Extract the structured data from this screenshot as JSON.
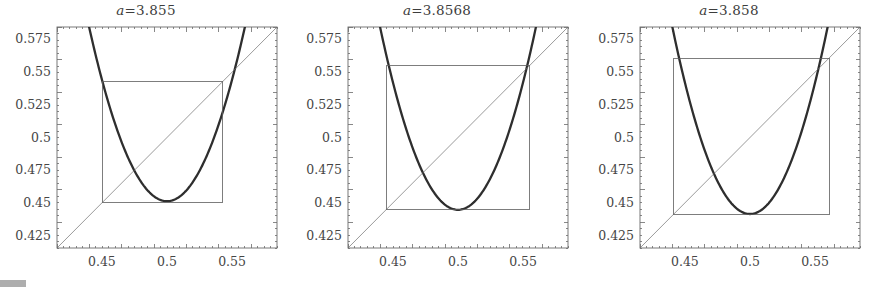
{
  "figure": {
    "background": "#ffffff",
    "curve_color": "#2e2e2e",
    "diagonal_color": "#6e6e6e",
    "box_color": "#5c5c5c",
    "frame_color": "#6a6a6a",
    "text_color": "#3d3d3d"
  },
  "caption_fragment": "",
  "chart_data": [
    {
      "type": "line",
      "title": "a=3.855",
      "title_parts": {
        "variable": "a",
        "relation": "=",
        "value": "3.855"
      },
      "parameter_a": 3.855,
      "xlabel": "",
      "ylabel": "",
      "xlim": [
        0.4155,
        0.5845
      ],
      "ylim": [
        0.4155,
        0.5845
      ],
      "grid": false,
      "legend": "none",
      "xticks": [
        0.45,
        0.5,
        0.55
      ],
      "xticklabels": [
        "0.45",
        "0.5",
        "0.55"
      ],
      "yticks": [
        0.425,
        0.45,
        0.475,
        0.5,
        0.525,
        0.55,
        0.575
      ],
      "yticklabels": [
        "0.425",
        "0.45",
        "0.475",
        "0.5",
        "0.525",
        "0.55",
        "0.575"
      ],
      "series": [
        {
          "name": "second-iterate-parabola",
          "kind": "parabola",
          "vertex": [
            0.5,
            0.4513
          ],
          "curvature": 37.2,
          "linewidth": 2.3
        },
        {
          "name": "identity-line",
          "kind": "diagonal",
          "x": [
            0.4155,
            0.5845
          ],
          "y": [
            0.4155,
            0.5845
          ],
          "linewidth": 0.7
        },
        {
          "name": "cobweb-box",
          "kind": "rectangle",
          "x0": 0.4505,
          "x1": 0.5425,
          "y0": 0.4505,
          "y1": 0.5425,
          "linewidth": 0.8
        }
      ]
    },
    {
      "type": "line",
      "title": "a=3.8568",
      "title_parts": {
        "variable": "a",
        "relation": "=",
        "value": "3.8568"
      },
      "parameter_a": 3.8568,
      "xlabel": "",
      "ylabel": "",
      "xlim": [
        0.4155,
        0.5845
      ],
      "ylim": [
        0.4155,
        0.5845
      ],
      "grid": false,
      "legend": "none",
      "xticks": [
        0.45,
        0.5,
        0.55
      ],
      "xticklabels": [
        "0.45",
        "0.5",
        "0.55"
      ],
      "yticks": [
        0.425,
        0.45,
        0.475,
        0.5,
        0.525,
        0.55,
        0.575
      ],
      "yticklabels": [
        "0.425",
        "0.45",
        "0.475",
        "0.5",
        "0.525",
        "0.55",
        "0.575"
      ],
      "series": [
        {
          "name": "second-iterate-parabola",
          "kind": "parabola",
          "vertex": [
            0.5,
            0.4447
          ],
          "curvature": 39.0,
          "linewidth": 2.3
        },
        {
          "name": "identity-line",
          "kind": "diagonal",
          "x": [
            0.4155,
            0.5845
          ],
          "y": [
            0.4155,
            0.5845
          ],
          "linewidth": 0.7
        },
        {
          "name": "cobweb-box",
          "kind": "rectangle",
          "x0": 0.4447,
          "x1": 0.5548,
          "y0": 0.4447,
          "y1": 0.5548,
          "linewidth": 0.8
        }
      ]
    },
    {
      "type": "line",
      "title": "a=3.858",
      "title_parts": {
        "variable": "a",
        "relation": "=",
        "value": "3.858"
      },
      "parameter_a": 3.858,
      "xlabel": "",
      "ylabel": "",
      "xlim": [
        0.4155,
        0.5845
      ],
      "ylim": [
        0.4155,
        0.5845
      ],
      "grid": false,
      "legend": "none",
      "xticks": [
        0.45,
        0.5,
        0.55
      ],
      "xticklabels": [
        "0.45",
        "0.5",
        "0.55"
      ],
      "yticks": [
        0.425,
        0.45,
        0.475,
        0.5,
        0.525,
        0.55,
        0.575
      ],
      "yticklabels": [
        "0.425",
        "0.45",
        "0.475",
        "0.5",
        "0.525",
        "0.55",
        "0.575"
      ],
      "series": [
        {
          "name": "second-iterate-parabola",
          "kind": "parabola",
          "vertex": [
            0.5,
            0.4415
          ],
          "curvature": 40.2,
          "linewidth": 2.3
        },
        {
          "name": "identity-line",
          "kind": "diagonal",
          "x": [
            0.4155,
            0.5845
          ],
          "y": [
            0.4155,
            0.5845
          ],
          "linewidth": 0.7
        },
        {
          "name": "cobweb-box",
          "kind": "rectangle",
          "x0": 0.4415,
          "x1": 0.5607,
          "y0": 0.4415,
          "y1": 0.5607,
          "linewidth": 0.8
        }
      ]
    }
  ]
}
